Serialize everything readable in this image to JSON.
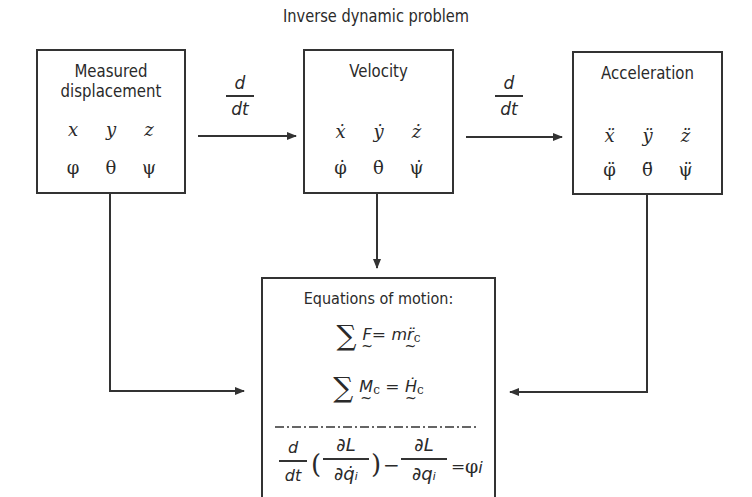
{
  "title": "Inverse dynamic problem",
  "boxes": {
    "displacement": {
      "label_line1": "Measured",
      "label_line2": "displacement",
      "translational": [
        "x",
        "y",
        "z"
      ],
      "rotational": [
        "φ",
        "θ",
        "ψ"
      ]
    },
    "velocity": {
      "label": "Velocity",
      "translational": [
        "ẋ",
        "ẏ",
        "ż"
      ],
      "rotational": [
        "φ̇",
        "θ̇",
        "ψ̇"
      ]
    },
    "acceleration": {
      "label": "Acceleration",
      "translational": [
        "ẍ",
        "ÿ",
        "z̈"
      ],
      "rotational": [
        "φ̈",
        "θ̈",
        "ψ̈"
      ]
    },
    "equations": {
      "label": "Equations of motion:",
      "eq1": {
        "sigma": "∑",
        "lhs": "F",
        "eq": "=",
        "rhs_m": "m",
        "rhs_r": "r̈",
        "rhs_sub": "c"
      },
      "eq2": {
        "sigma": "∑",
        "lhs": "M",
        "lhs_sub": "c",
        "eq": "=",
        "rhs": "Ḣ",
        "rhs_sub": "c"
      },
      "lagrange": {
        "d": "d",
        "dt": "dt",
        "partialL": "∂L",
        "partial_qdot": "∂q̇ᵢ",
        "partial_q": "∂qᵢ",
        "minus": "−",
        "eq": "=",
        "rhs": "φ",
        "rhs_sub": "i"
      }
    }
  },
  "arrows": {
    "derivative_1": {
      "numerator": "d",
      "denominator": "dt"
    },
    "derivative_2": {
      "numerator": "d",
      "denominator": "dt"
    }
  },
  "colors": {
    "stroke": "#333333",
    "text": "#2a2a2a",
    "background": "#ffffff"
  }
}
